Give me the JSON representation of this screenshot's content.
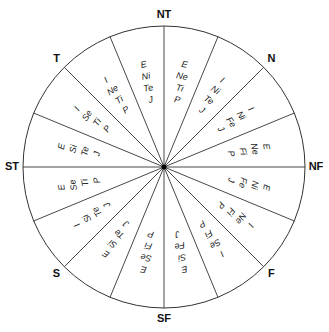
{
  "diagram": {
    "type": "type-wheel",
    "center": [
      164,
      167
    ],
    "radius": 141,
    "stroke_color": "#333333",
    "axis_labels": [
      {
        "label": "NT",
        "angle": 90
      },
      {
        "label": "N",
        "angle": 45
      },
      {
        "label": "NF",
        "angle": 0
      },
      {
        "label": "F",
        "angle": -45
      },
      {
        "label": "SF",
        "angle": -90
      },
      {
        "label": "S",
        "angle": -135
      },
      {
        "label": "ST",
        "angle": 180
      },
      {
        "label": "T",
        "angle": 135
      }
    ],
    "sectors": [
      {
        "lines": [
          "E",
          "Ne",
          "Ti",
          "P"
        ]
      },
      {
        "lines": [
          "I",
          "Ni",
          "Te",
          "J"
        ]
      },
      {
        "lines": [
          "I",
          "Ni",
          "Fe",
          "J"
        ]
      },
      {
        "lines": [
          "E",
          "Ne",
          "Fi",
          "P"
        ]
      },
      {
        "lines": [
          "E",
          "Ni",
          "Fe",
          "J"
        ]
      },
      {
        "lines": [
          "I",
          "Ne",
          "Fi",
          "P"
        ]
      },
      {
        "lines": [
          "I",
          "Se",
          "Fi",
          "P"
        ]
      },
      {
        "lines": [
          "E",
          "Si",
          "Fe",
          "J"
        ]
      },
      {
        "lines": [
          "E",
          "Se",
          "Fi",
          "P"
        ]
      },
      {
        "lines": [
          "E",
          "Si",
          "Te",
          "J"
        ]
      },
      {
        "lines": [
          "I",
          "Si",
          "Te",
          "J"
        ]
      },
      {
        "lines": [
          "E",
          "Se",
          "Ti",
          "P"
        ]
      },
      {
        "lines": [
          "E",
          "Si",
          "Te",
          "J"
        ]
      },
      {
        "lines": [
          "I",
          "Se",
          "Ti",
          "P"
        ]
      },
      {
        "lines": [
          "I",
          "Ne",
          "Ti",
          "P"
        ]
      },
      {
        "lines": [
          "E",
          "Ni",
          "Te",
          "J"
        ]
      }
    ]
  }
}
